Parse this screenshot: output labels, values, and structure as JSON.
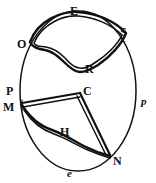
{
  "figure": {
    "stroke_color": "#111111",
    "background_color": "#ffffff"
  },
  "circle": {
    "name": "outer-circle",
    "center_x": 78,
    "center_y": 91,
    "radius_x": 58,
    "radius_y": 80,
    "stroke_width": 1.4
  },
  "labels": [
    {
      "id": "E",
      "text": "E",
      "style": "upper",
      "x": 70,
      "y": 5,
      "anchor": "top-arc"
    },
    {
      "id": "S",
      "text": "S",
      "style": "upper",
      "x": 120,
      "y": 26,
      "anchor": "upper-right-vertex"
    },
    {
      "id": "O",
      "text": "O",
      "style": "upper",
      "x": 17,
      "y": 38,
      "anchor": "upper-left-vertex"
    },
    {
      "id": "R",
      "text": "R",
      "style": "upper",
      "x": 85,
      "y": 63,
      "anchor": "upper-region"
    },
    {
      "id": "C",
      "text": "C",
      "style": "upper",
      "x": 83,
      "y": 85,
      "anchor": "center-vertex"
    },
    {
      "id": "P",
      "text": "P",
      "style": "upper",
      "x": 6,
      "y": 85,
      "anchor": "left-arc"
    },
    {
      "id": "M",
      "text": "M",
      "style": "upper",
      "x": 3,
      "y": 101,
      "anchor": "left-vertex"
    },
    {
      "id": "H",
      "text": "H",
      "style": "upper",
      "x": 60,
      "y": 126,
      "anchor": "lower-region"
    },
    {
      "id": "N",
      "text": "N",
      "style": "upper",
      "x": 113,
      "y": 155,
      "anchor": "lower-right-vertex"
    },
    {
      "id": "p",
      "text": "p",
      "style": "italic",
      "x": 141,
      "y": 96,
      "anchor": "right-arc"
    },
    {
      "id": "e",
      "text": "e",
      "style": "italic",
      "x": 67,
      "y": 168,
      "anchor": "bottom-arc"
    }
  ],
  "subscript_mark": {
    "id": "S-mark",
    "text": ".",
    "x": 124,
    "y": 37
  },
  "regions": [
    {
      "id": "upper-region",
      "name": "region-OESR",
      "vertices": [
        "O",
        "E",
        "S",
        "R"
      ],
      "label": "R",
      "outline": "double"
    },
    {
      "id": "lower-region",
      "name": "region-MCNH",
      "vertices": [
        "M",
        "C",
        "N",
        "H"
      ],
      "label": "H",
      "outline": "double"
    }
  ],
  "arcs": [
    {
      "id": "arc-p",
      "label": "p",
      "side": "right"
    },
    {
      "id": "arc-e",
      "label": "e",
      "side": "bottom"
    }
  ]
}
